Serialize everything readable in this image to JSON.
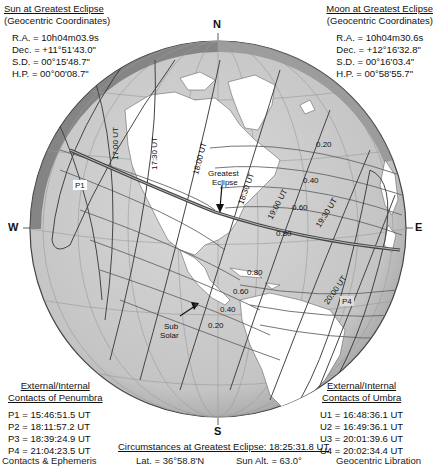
{
  "sun_panel": {
    "title": "Sun at Greatest Eclipse",
    "subtitle": "(Geocentric Coordinates)",
    "rows": [
      "R.A. = 10h04m03.9s",
      "Dec. = +11°51'43.0\"",
      "S.D. =  00°15'48.7\"",
      "H.P. =  00°00'08.7\""
    ]
  },
  "moon_panel": {
    "title": "Moon at Greatest Eclipse",
    "subtitle": "(Geocentric Coordinates)",
    "rows": [
      "R.A. = 10h04m30.6s",
      "Dec. = +12°16'32.8\"",
      "S.D. =  00°16'03.4\"",
      "H.P. =  00°58'55.7\""
    ]
  },
  "penumbra_panel": {
    "title": "External/Internal",
    "subtitle": "Contacts of Penumbra",
    "rows": [
      "P1 = 15:46:51.5 UT",
      "P2 = 18:11:57.2 UT",
      "P3 = 18:39:24.9 UT",
      "P4 = 21:04:23.5 UT"
    ]
  },
  "umbra_panel": {
    "title": "External/Internal",
    "subtitle": "Contacts of Umbra",
    "rows": [
      "U1 = 16:48:36.1 UT",
      "U2 = 16:49:36.1 UT",
      "U3 = 20:01:39.6 UT",
      "U4 = 20:02:34.4 UT"
    ]
  },
  "compass": {
    "north": "N",
    "south": "S",
    "east": "E",
    "west": "W"
  },
  "circumstances": {
    "title": "Circumstances at Greatest Eclipse:  18:25:31.8 UT",
    "partial_row": [
      "Contacts & Ephemeris",
      "Lat. =  36°58.8'N",
      "Sun Alt. =  63.0°",
      "Geocentric Libration"
    ]
  },
  "map_labels": {
    "time_lines": [
      "17:00 UT",
      "17:30 UT",
      "18:00 UT",
      "18:30 UT",
      "19:00 UT",
      "19:30 UT",
      "20:00 UT"
    ],
    "magnitude_north": [
      "0.20",
      "0.40",
      "0.60",
      "0.80"
    ],
    "magnitude_south": [
      "0.80",
      "0.60",
      "0.40",
      "0.20"
    ],
    "greatest_eclipse": [
      "Greatest",
      "Eclipse"
    ],
    "sub_solar": [
      "Sub",
      "Solar"
    ],
    "p1": "P1",
    "p4": "P4"
  },
  "colors": {
    "ocean": "#c9c9c9",
    "land": "#ffffff",
    "limb_shadow": "#5a5a5a",
    "grid": "#8a8a8a",
    "lines": "#333333",
    "path": "#444444"
  }
}
